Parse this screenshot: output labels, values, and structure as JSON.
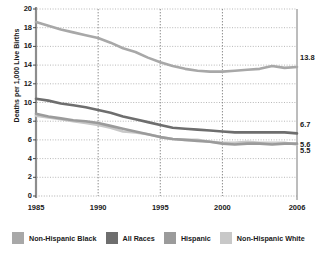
{
  "chart_data": {
    "type": "line",
    "title": "",
    "xlabel": "",
    "ylabel": "Deaths per 1,000 Live Births",
    "xlim": [
      1985,
      2006
    ],
    "ylim": [
      0,
      20
    ],
    "grid": true,
    "legend_position": "bottom",
    "ytick_labels": [
      "20",
      "18",
      "16",
      "14",
      "12",
      "10",
      "8",
      "6",
      "4",
      "2",
      "0"
    ],
    "ytick_values": [
      20,
      18,
      16,
      14,
      12,
      10,
      8,
      6,
      4,
      2,
      0
    ],
    "xtick_labels": [
      "1985",
      "1990",
      "1995",
      "2000",
      "2006"
    ],
    "xtick_values": [
      1985,
      1990,
      1995,
      2000,
      2006
    ],
    "x": [
      1985,
      1986,
      1987,
      1988,
      1989,
      1990,
      1991,
      1992,
      1993,
      1994,
      1995,
      1996,
      1997,
      1998,
      1999,
      2000,
      2001,
      2002,
      2003,
      2004,
      2005,
      2006
    ],
    "series": [
      {
        "name": "Non-Hispanic Black",
        "color": "#a8a8a8",
        "end_label": "13.8",
        "values": [
          18.6,
          18.2,
          17.8,
          17.5,
          17.2,
          16.9,
          16.4,
          15.8,
          15.4,
          14.8,
          14.3,
          13.9,
          13.6,
          13.4,
          13.3,
          13.3,
          13.4,
          13.5,
          13.6,
          13.9,
          13.7,
          13.8
        ]
      },
      {
        "name": "All Races",
        "color": "#6e6e6e",
        "end_label": "6.7",
        "values": [
          10.4,
          10.2,
          9.9,
          9.7,
          9.5,
          9.2,
          8.9,
          8.5,
          8.2,
          7.9,
          7.6,
          7.3,
          7.2,
          7.1,
          7.0,
          6.9,
          6.8,
          6.8,
          6.8,
          6.8,
          6.8,
          6.7
        ]
      },
      {
        "name": "Hispanic",
        "color": "#9b9b9b",
        "end_label": "5.6",
        "values": [
          8.8,
          8.5,
          8.3,
          8.1,
          8.0,
          7.8,
          7.5,
          7.2,
          6.9,
          6.6,
          6.3,
          6.1,
          6.0,
          5.9,
          5.8,
          5.6,
          5.5,
          5.6,
          5.6,
          5.5,
          5.6,
          5.6
        ]
      },
      {
        "name": "Non-Hispanic White",
        "color": "#c8c8c8",
        "end_label": "5.5",
        "values": [
          8.6,
          8.4,
          8.2,
          8.0,
          7.8,
          7.6,
          7.3,
          6.9,
          6.8,
          6.6,
          6.3,
          6.1,
          6.0,
          6.0,
          5.8,
          5.7,
          5.7,
          5.8,
          5.7,
          5.7,
          5.7,
          5.5
        ]
      }
    ]
  },
  "legend": {
    "items": [
      {
        "label": "Non-Hispanic Black",
        "color": "#a8a8a8"
      },
      {
        "label": "All Races",
        "color": "#6e6e6e"
      },
      {
        "label": "Hispanic",
        "color": "#9b9b9b"
      },
      {
        "label": "Non-Hispanic White",
        "color": "#c8c8c8"
      }
    ]
  },
  "axis": {
    "y_title": "Deaths per 1,000 Live Births"
  }
}
